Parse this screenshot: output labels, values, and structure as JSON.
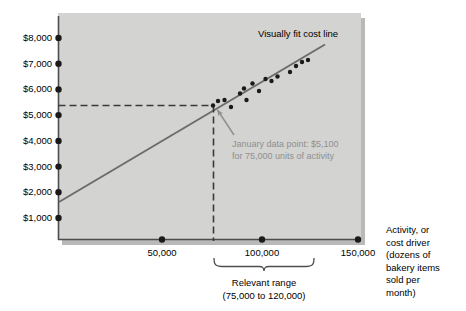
{
  "chart_data": {
    "type": "scatter",
    "title": "",
    "xlabel": "Activity, or cost driver (dozens of bakery items sold per month)",
    "ylabel": "",
    "xlim": [
      0,
      156000
    ],
    "ylim": [
      0,
      8600
    ],
    "grid": false,
    "legend": "none",
    "y_tick_labels": [
      "$8,000",
      "$7,000",
      "$6,000",
      "$5,000",
      "$4,000",
      "$3,000",
      "$2,000",
      "$1,000"
    ],
    "y_tick_values": [
      8000,
      7000,
      6000,
      5000,
      4000,
      3000,
      2000,
      1000
    ],
    "x_tick_labels": [
      "50,000",
      "100,000",
      "150,000"
    ],
    "x_tick_values": [
      50000,
      100000,
      150000
    ],
    "series": [
      {
        "name": "Monthly cost observations",
        "type": "scatter",
        "points": [
          {
            "x": 75000,
            "y": 5100
          },
          {
            "x": 77000,
            "y": 5450
          },
          {
            "x": 80000,
            "y": 5500
          },
          {
            "x": 83000,
            "y": 5200
          },
          {
            "x": 87000,
            "y": 5750
          },
          {
            "x": 89000,
            "y": 5950
          },
          {
            "x": 90000,
            "y": 5500
          },
          {
            "x": 93000,
            "y": 6150
          },
          {
            "x": 96000,
            "y": 5850
          },
          {
            "x": 99000,
            "y": 6300
          },
          {
            "x": 102000,
            "y": 6250
          },
          {
            "x": 105000,
            "y": 6400
          },
          {
            "x": 111000,
            "y": 6550
          },
          {
            "x": 114000,
            "y": 6800
          },
          {
            "x": 117000,
            "y": 6950
          },
          {
            "x": 120000,
            "y": 7000
          }
        ]
      },
      {
        "name": "Visually fit cost line",
        "type": "line",
        "x_start": 0,
        "y_start": 1550,
        "x_end": 131000,
        "y_end": 7700
      }
    ],
    "annotations": [
      {
        "name": "visually-fit-cost-line-label",
        "text": "Visually fit cost line"
      },
      {
        "name": "january-data-point-callout",
        "line1": "January data point: $5,100",
        "line2": "for 75,000 units of activity",
        "target_x": 75000,
        "target_y": 5100
      },
      {
        "name": "relevant-range-bracket",
        "line1": "Relevant range",
        "line2": "(75,000 to 120,000)",
        "from_x": 75000,
        "to_x": 120000
      }
    ],
    "reference_lines": {
      "horizontal_dashed_y": 5250,
      "vertical_dashed_x": 75000
    },
    "x_axis_caption": {
      "line1": "Activity, or",
      "line2": "cost driver",
      "line3": "(dozens of",
      "line4": "bakery items",
      "line5": "sold per",
      "line6": "month)"
    },
    "colors": {
      "plot_background": "#d3d3d1",
      "axis": "#4d4d4d",
      "cost_line": "#6b6b6b",
      "data_point": "#1a1a1a",
      "dashed_guide": "#3a3a3a",
      "callout_text": "#8f8f8f",
      "text": "#000000"
    }
  }
}
